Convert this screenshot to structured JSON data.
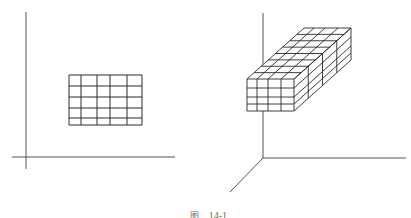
{
  "figure": {
    "caption_prefix": "图",
    "caption_number": "14-1",
    "line_color": "#2a2a2a",
    "axis_color": "#555555"
  },
  "left_panel": {
    "description": "2D rectangular grid in a 2-axis coordinate frame",
    "axes": {
      "vertical": {
        "x": 26,
        "y1": 12,
        "y2": 169
      },
      "horizontal": {
        "y": 157,
        "x1": 12,
        "x2": 175
      }
    },
    "grid": {
      "x": [
        69,
        81,
        97,
        110,
        127,
        142
      ],
      "y": [
        75,
        86,
        97,
        108,
        118,
        125
      ],
      "columns": 5,
      "rows": 5
    }
  },
  "right_panel": {
    "description": "3D block of stacked 4x4 grid slices in a 3-axis coordinate frame",
    "axes": {
      "origin": [
        263,
        158
      ],
      "vertical_top": [
        263,
        13
      ],
      "horizontal_end": [
        406,
        158
      ],
      "diagonal_end": [
        230,
        192
      ]
    },
    "front_face": {
      "x": [
        247,
        257,
        268,
        281,
        294
      ],
      "y": [
        79,
        88,
        97,
        104,
        111
      ],
      "columns": 4,
      "rows": 4
    },
    "depth_vector": [
      57,
      -51
    ],
    "depth_slices": 4
  }
}
